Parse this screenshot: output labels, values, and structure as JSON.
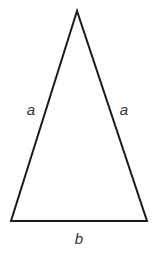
{
  "diagram": {
    "type": "isosceles-triangle",
    "stroke_color": "#1a1a1a",
    "stroke_width": 2,
    "vertices": {
      "apex": [
        77,
        11
      ],
      "bottom_left": [
        11,
        221
      ],
      "bottom_right": [
        147,
        221
      ]
    },
    "labels": {
      "left_side": "a",
      "right_side": "a",
      "base": "b"
    }
  }
}
